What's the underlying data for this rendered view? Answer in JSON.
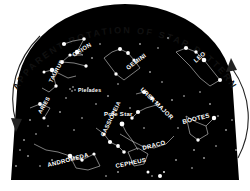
{
  "diagram": {
    "title": "APPARENT ROTATION OF STAR PATTERN",
    "background_color": "#ffffff",
    "sky_color": "#000000",
    "star_color": "#ffffff",
    "title_color": "#111111",
    "rotation_direction": "counterclockwise",
    "arrows": [
      {
        "name": "left-rotation-arrow",
        "direction": "downward",
        "side": "left"
      },
      {
        "name": "right-rotation-arrow",
        "direction": "upward",
        "side": "right"
      }
    ],
    "pole_star_label": "Pole Star",
    "cluster_label": "Pleiades"
  },
  "constellations": [
    {
      "name": "ORION",
      "label": "ORION",
      "x": 74,
      "y": 57,
      "rot": -32,
      "size": 6.0
    },
    {
      "name": "TAURUS",
      "label": "TAURUS",
      "x": 52,
      "y": 83,
      "rot": -62,
      "size": 5.6
    },
    {
      "name": "GEMINI",
      "label": "GEMINI",
      "x": 128,
      "y": 70,
      "rot": -36,
      "size": 6.0
    },
    {
      "name": "LEO",
      "label": "LEO",
      "x": 196,
      "y": 63,
      "rot": -42,
      "size": 6.0
    },
    {
      "name": "ARIES",
      "label": "ARIES",
      "x": 41,
      "y": 114,
      "rot": -60,
      "size": 5.6
    },
    {
      "name": "ANDROMEDA",
      "label": "ANDROMEDA",
      "x": 72,
      "y": 167,
      "rot": -14,
      "size": 6.0
    },
    {
      "name": "CASSIOPEIA",
      "label": "CASSIOPEIA",
      "x": 104,
      "y": 137,
      "rot": -64,
      "size": 5.8
    },
    {
      "name": "CEPHEUS",
      "label": "CEPHEUS",
      "x": 137,
      "y": 166,
      "rot": -12,
      "size": 6.0
    },
    {
      "name": "DRACO",
      "label": "DRACO",
      "x": 143,
      "y": 150,
      "rot": -14,
      "size": 6.0
    },
    {
      "name": "URSA MAJOR",
      "label": "URSA MAJOR",
      "x": 157,
      "y": 96,
      "rot": 44,
      "size": 6.0
    },
    {
      "name": "BOOTES",
      "label": "BOOTES",
      "x": 199,
      "y": 124,
      "rot": -14,
      "size": 6.2
    },
    {
      "name": "POLE STAR",
      "label": "Pole Star",
      "x": 122,
      "y": 116,
      "rot": 0,
      "size": 6.0
    }
  ],
  "star_figures": {
    "orion": [
      [
        64,
        44
      ],
      [
        73,
        41
      ],
      [
        84,
        39
      ],
      [
        77,
        52
      ],
      [
        83,
        55
      ],
      [
        70,
        55
      ],
      [
        62,
        62
      ],
      [
        74,
        63
      ],
      [
        86,
        66
      ]
    ],
    "taurus": [
      [
        44,
        72
      ],
      [
        52,
        70
      ],
      [
        60,
        74
      ],
      [
        68,
        78
      ],
      [
        76,
        76
      ],
      [
        56,
        86
      ],
      [
        49,
        92
      ],
      [
        42,
        88
      ]
    ],
    "gemini": [
      [
        104,
        58
      ],
      [
        112,
        52
      ],
      [
        120,
        49
      ],
      [
        128,
        53
      ],
      [
        134,
        60
      ],
      [
        140,
        68
      ],
      [
        132,
        74
      ],
      [
        124,
        80
      ],
      [
        116,
        74
      ],
      [
        110,
        66
      ]
    ],
    "leo": [
      [
        176,
        52
      ],
      [
        186,
        48
      ],
      [
        196,
        52
      ],
      [
        204,
        60
      ],
      [
        212,
        70
      ],
      [
        220,
        80
      ],
      [
        210,
        86
      ],
      [
        200,
        78
      ],
      [
        190,
        66
      ],
      [
        182,
        58
      ]
    ],
    "aries": [
      [
        30,
        108
      ],
      [
        40,
        104
      ],
      [
        50,
        108
      ],
      [
        44,
        118
      ]
    ],
    "andromeda": [
      [
        34,
        144
      ],
      [
        46,
        150
      ],
      [
        58,
        152
      ],
      [
        70,
        156
      ],
      [
        82,
        160
      ],
      [
        94,
        154
      ],
      [
        100,
        166
      ],
      [
        88,
        170
      ],
      [
        76,
        168
      ],
      [
        64,
        162
      ]
    ],
    "cassiopeia": [
      [
        96,
        128
      ],
      [
        104,
        134
      ],
      [
        110,
        142
      ],
      [
        118,
        146
      ],
      [
        124,
        152
      ]
    ],
    "cepheus": [
      [
        128,
        152
      ],
      [
        138,
        148
      ],
      [
        148,
        154
      ],
      [
        144,
        164
      ],
      [
        134,
        166
      ]
    ],
    "draco": [
      [
        120,
        134
      ],
      [
        130,
        140
      ],
      [
        142,
        146
      ],
      [
        154,
        148
      ],
      [
        166,
        144
      ],
      [
        174,
        136
      ]
    ],
    "ursa_major": [
      [
        136,
        94
      ],
      [
        144,
        92
      ],
      [
        152,
        98
      ],
      [
        160,
        104
      ],
      [
        146,
        108
      ],
      [
        138,
        112
      ],
      [
        132,
        118
      ]
    ],
    "bootes": [
      [
        186,
        116
      ],
      [
        196,
        122
      ],
      [
        206,
        126
      ],
      [
        214,
        118
      ],
      [
        208,
        134
      ],
      [
        198,
        140
      ],
      [
        190,
        134
      ]
    ]
  }
}
